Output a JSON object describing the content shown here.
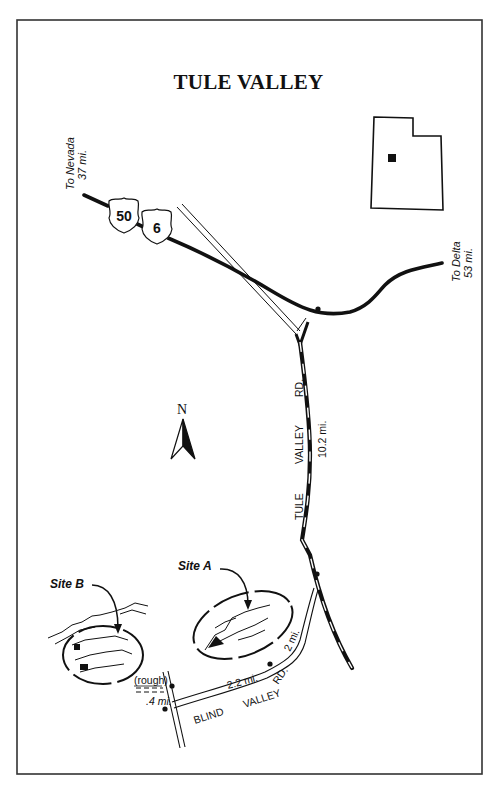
{
  "map": {
    "title": "TULE VALLEY",
    "colors": {
      "ink": "#111111",
      "background": "#ffffff",
      "border": "#333333"
    },
    "north_arrow": {
      "label": "N",
      "icon": "north-arrow-icon"
    },
    "locator_map": {
      "state_outline": "utah-outline-icon",
      "marker": "location-square-icon"
    },
    "highway_shields": [
      {
        "number": "50",
        "icon": "us-highway-shield-icon"
      },
      {
        "number": "6",
        "icon": "us-highway-shield-icon"
      }
    ],
    "destinations": {
      "nevada": {
        "line1": "To Nevada",
        "line2": "37 mi."
      },
      "delta": {
        "line1": "To Delta",
        "line2": "53 mi."
      }
    },
    "roads": {
      "tule_valley_rd": {
        "name_words": [
          "TULE",
          "VALLEY",
          "RD."
        ],
        "distance": "10.2 mi."
      },
      "blind_valley_rd": {
        "name_words": [
          "BLIND",
          "VALLEY",
          "RD."
        ],
        "distance_main": "2.2 mi.",
        "distance_spur": "2 mi."
      },
      "rough_spur": {
        "label": "(rough)",
        "distance": ".4 mi."
      }
    },
    "sites": [
      {
        "label": "Site A"
      },
      {
        "label": "Site B"
      }
    ]
  }
}
